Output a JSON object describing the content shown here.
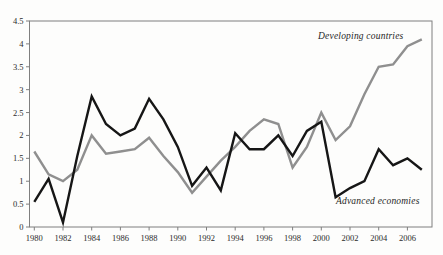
{
  "figure": {
    "background": "#fdfdfc",
    "frame_color": "#7f7f7f",
    "tick_color": "#7f7f7f",
    "tick_text_color": "#2b2b2b"
  },
  "chart_data": {
    "type": "line",
    "title": "",
    "xlabel": "",
    "ylabel": "",
    "grid": false,
    "legend_position": "inline-annotations",
    "x": [
      1980,
      1981,
      1982,
      1983,
      1984,
      1985,
      1986,
      1987,
      1988,
      1989,
      1990,
      1991,
      1992,
      1993,
      1994,
      1995,
      1996,
      1997,
      1998,
      1999,
      2000,
      2001,
      2002,
      2003,
      2004,
      2005,
      2006,
      2007
    ],
    "series": [
      {
        "name": "Developing countries",
        "color": "#8f8f8f",
        "values": [
          1.65,
          1.15,
          1.0,
          1.25,
          2.0,
          1.6,
          1.65,
          1.7,
          1.95,
          1.55,
          1.2,
          0.75,
          1.1,
          1.45,
          1.75,
          2.1,
          2.35,
          2.25,
          1.3,
          1.75,
          2.5,
          1.9,
          2.2,
          2.9,
          3.5,
          3.55,
          3.95,
          4.1
        ]
      },
      {
        "name": "Advanced economies",
        "color": "#161616",
        "values": [
          0.55,
          1.05,
          0.1,
          1.55,
          2.85,
          2.25,
          2.0,
          2.15,
          2.8,
          2.35,
          1.75,
          0.9,
          1.3,
          0.8,
          2.05,
          1.7,
          1.7,
          2.0,
          1.55,
          2.1,
          2.3,
          0.65,
          0.85,
          1.0,
          1.7,
          1.35,
          1.5,
          1.25
        ]
      }
    ],
    "ylim": [
      0,
      4.5
    ],
    "yticks": [
      0,
      0.5,
      1,
      1.5,
      2,
      2.5,
      3,
      3.5,
      4,
      4.5
    ],
    "ytick_labels": [
      "0",
      "0.5",
      "1",
      "1.5",
      "2",
      "2.5",
      "3",
      "3.5",
      "4",
      "4.5"
    ],
    "xticks": [
      1980,
      1982,
      1984,
      1986,
      1988,
      1990,
      1992,
      1994,
      1996,
      1998,
      2000,
      2002,
      2004,
      2006
    ],
    "xtick_labels": [
      "1980",
      "1982",
      "1984",
      "1986",
      "1988",
      "1990",
      "1992",
      "1994",
      "1996",
      "1998",
      "2000",
      "2002",
      "2004",
      "2006"
    ]
  }
}
